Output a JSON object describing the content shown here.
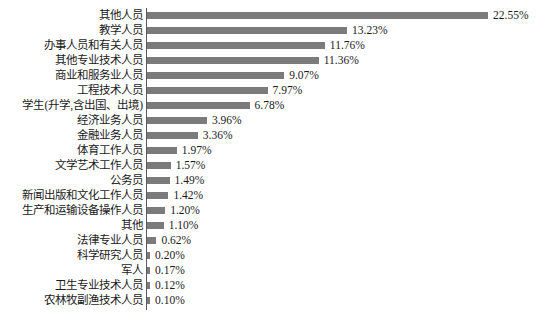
{
  "chart_data": {
    "type": "bar",
    "orientation": "horizontal",
    "title": "",
    "subtitle": "",
    "xlabel": "",
    "ylabel": "",
    "xlim": [
      0,
      22.55
    ],
    "grid": false,
    "legend": null,
    "value_suffix": "%",
    "bar_color": "#7b7b7b",
    "axis_color": "#5a5a5a",
    "text_color": "#1a1a1a",
    "categories": [
      "其他人员",
      "教学人员",
      "办事人员和有关人员",
      "其他专业技术人员",
      "商业和服务业人员",
      "工程技术人员",
      "学生(升学,含出国、出境)",
      "经济业务人员",
      "金融业务人员",
      "体育工作人员",
      "文学艺术工作人员",
      "公务员",
      "新闻出版和文化工作人员",
      "生产和运输设备操作人员",
      "其他",
      "法律专业人员",
      "科学研究人员",
      "军人",
      "卫生专业技术人员",
      "农林牧副渔技术人员"
    ],
    "values": [
      22.55,
      13.23,
      11.76,
      11.36,
      9.07,
      7.97,
      6.78,
      3.96,
      3.36,
      1.97,
      1.57,
      1.49,
      1.42,
      1.2,
      1.1,
      0.62,
      0.2,
      0.17,
      0.12,
      0.1
    ],
    "value_labels": [
      "22.55%",
      "13.23%",
      "11.76%",
      "11.36%",
      "9.07%",
      "7.97%",
      "6.78%",
      "3.96%",
      "3.36%",
      "1.97%",
      "1.57%",
      "1.49%",
      "1.42%",
      "1.20%",
      "1.10%",
      "0.62%",
      "0.20%",
      "0.17%",
      "0.12%",
      "0.10%"
    ]
  }
}
